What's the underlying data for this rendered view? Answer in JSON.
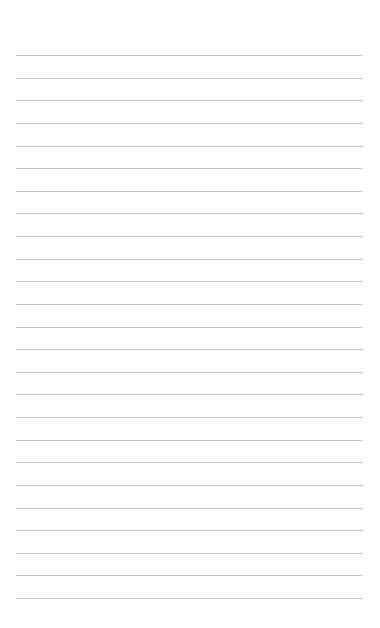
{
  "page": {
    "type": "lined-paper",
    "background_color": "#fdfdfd",
    "line_color": "#c4c4c4",
    "line_count": 25,
    "first_line_y": 55,
    "line_spacing": 22.63,
    "line_left": 16,
    "line_right": 363
  }
}
